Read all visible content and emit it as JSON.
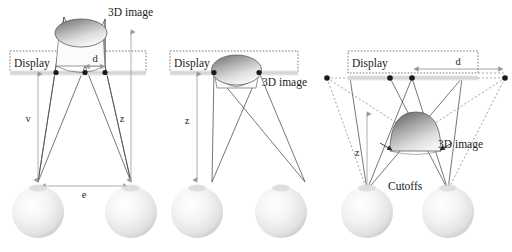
{
  "figure": {
    "title": "",
    "background": "#ffffff",
    "panels": [
      {
        "id": "panel-left",
        "display_label": "Display",
        "image_label": "3D image",
        "labels": {
          "v": "v",
          "z": "z",
          "e": "e",
          "d": "d"
        },
        "image_shape": "disc-cone-above-display",
        "display_dots": 3,
        "eye_count": 2
      },
      {
        "id": "panel-middle",
        "display_label": "Display",
        "image_label": "3D image",
        "labels": {
          "z": "z"
        },
        "image_shape": "disc-cone-on-display",
        "display_dots": 2,
        "eye_count": 2
      },
      {
        "id": "panel-right",
        "display_label": "Display",
        "image_label": "3D image",
        "cutoffs_label": "Cutoffs",
        "labels": {
          "z": "z",
          "d": "d"
        },
        "image_shape": "dome-below-display",
        "display_dots": 4,
        "eye_count": 2
      }
    ],
    "colors": {
      "display_bar": "#d4d4d4",
      "display_box_border": "#555555",
      "ray": "#4a4a4a",
      "dashed_ray": "#8a8a8a",
      "dim_arrow": "#9a9a9a",
      "dot": "#1a1a1a",
      "sphere_light": "#ffffff",
      "sphere_mid": "#e9e9e9",
      "sphere_dark": "#bdbdbd",
      "image_dark": "#6e6e6e",
      "image_light": "#f2f2f2",
      "text": "#1a1a1a"
    }
  }
}
